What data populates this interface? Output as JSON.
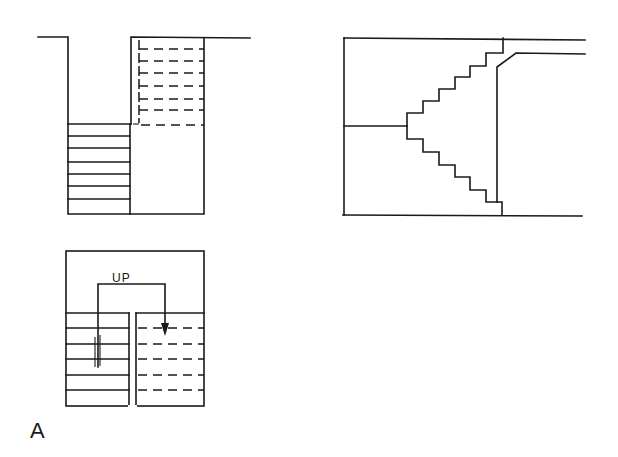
{
  "figure": {
    "label": "A",
    "style": {
      "line_color": "#1a1a1a",
      "background": "#ffffff"
    }
  },
  "section_view": {
    "description": "Section of dog-leg stair: lower flight (solid treads) and upper flight (dashed treads)",
    "solid_treads": 7,
    "dashed_treads": 7
  },
  "side_elevation": {
    "description": "Stair elevation with steps ascending and descending from a central landing",
    "upper_steps": 6,
    "lower_steps": 6
  },
  "plan_view": {
    "direction_label": "UP",
    "solid_treads": 5,
    "dashed_treads": 4,
    "break_mark": "double-line break"
  }
}
